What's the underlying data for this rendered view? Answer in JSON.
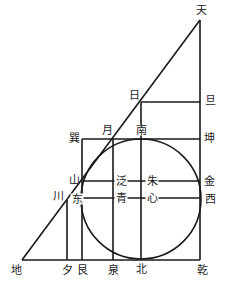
{
  "diagram": {
    "title": "",
    "line_color": "#1a1a1a",
    "labels": {
      "tian": "天",
      "ri": "日",
      "dan": "旦",
      "yue": "月",
      "nan": "南",
      "xun": "巽",
      "kun": "坤",
      "shan": "山",
      "fan": "泛",
      "zhu": "朱",
      "jin": "金",
      "chuan": "川",
      "dong": "东",
      "qing": "青",
      "xin": "心",
      "xi": "西",
      "di": "地",
      "xi_evening": "夕",
      "gen": "艮",
      "quan": "泉",
      "bei": "北",
      "qian": "乾"
    }
  }
}
